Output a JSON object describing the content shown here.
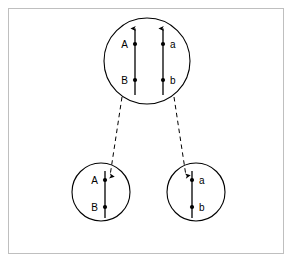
{
  "figure": {
    "name": "cell-division-chromosome-diagram",
    "background_color": "#ffffff",
    "frame_color": "#bfbfbf",
    "ink_color": "#000000",
    "cells": [
      {
        "id": "parent-cell",
        "role": "parent",
        "cx": 147,
        "cy": 61,
        "r": 43,
        "chromosomes": [
          {
            "id": "chromosome-left",
            "x": 135,
            "top": 27,
            "bottom": 95,
            "arrow": "up",
            "loci": [
              {
                "label": "A",
                "y": 44,
                "label_side": "left"
              },
              {
                "label": "B",
                "y": 80,
                "label_side": "left"
              }
            ]
          },
          {
            "id": "chromosome-right",
            "x": 163,
            "top": 27,
            "bottom": 95,
            "arrow": "up",
            "loci": [
              {
                "label": "a",
                "y": 44,
                "label_side": "right"
              },
              {
                "label": "b",
                "y": 80,
                "label_side": "right"
              }
            ]
          }
        ]
      },
      {
        "id": "daughter-cell-left",
        "role": "daughter",
        "cx": 101,
        "cy": 192,
        "r": 29,
        "chromosomes": [
          {
            "id": "chromosome-A-B",
            "x": 105,
            "top": 171,
            "bottom": 218,
            "arrow": "none",
            "loci": [
              {
                "label": "A",
                "y": 180,
                "label_side": "left"
              },
              {
                "label": "B",
                "y": 207,
                "label_side": "left"
              }
            ]
          }
        ]
      },
      {
        "id": "daughter-cell-right",
        "role": "daughter",
        "cx": 196,
        "cy": 192,
        "r": 29,
        "chromosomes": [
          {
            "id": "chromosome-a-b",
            "x": 192,
            "top": 171,
            "bottom": 218,
            "arrow": "none",
            "loci": [
              {
                "label": "a",
                "y": 180,
                "label_side": "right"
              },
              {
                "label": "b",
                "y": 207,
                "label_side": "right"
              }
            ]
          }
        ]
      }
    ],
    "connectors": [
      {
        "id": "connector-to-left-daughter",
        "style": "dashed",
        "from": {
          "x": 122,
          "y": 97
        },
        "to": {
          "x": 110,
          "y": 180
        },
        "arrow": "down-at-end"
      },
      {
        "id": "connector-to-right-daughter",
        "style": "dashed",
        "from": {
          "x": 174,
          "y": 97
        },
        "to": {
          "x": 186,
          "y": 180
        },
        "arrow": "down-at-end"
      }
    ]
  }
}
